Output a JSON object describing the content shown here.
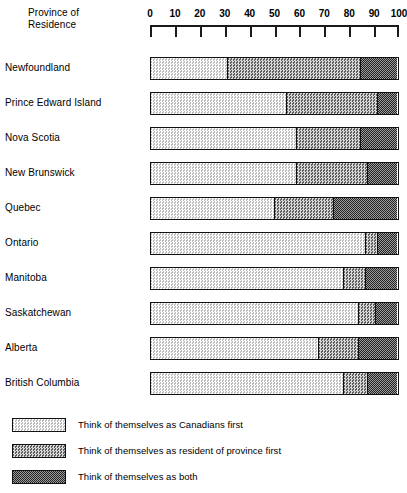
{
  "chart_data": {
    "type": "bar",
    "orientation": "horizontal",
    "stacked": true,
    "title": "Province of\nResidence",
    "xlabel": "",
    "ylabel": "Province of Residence",
    "xlim": [
      0,
      100
    ],
    "grid": false,
    "legend_position": "bottom-left",
    "axis_ticks": [
      0,
      10,
      20,
      30,
      40,
      50,
      60,
      70,
      80,
      90,
      100
    ],
    "axis_tick_labels": [
      "0",
      "10",
      "20",
      "30",
      "40",
      "50",
      "60",
      "70",
      "80",
      "90",
      "100"
    ],
    "categories": [
      "Newfoundland",
      "Prince Edward Island",
      "Nova Scotia",
      "New Brunswick",
      "Quebec",
      "Ontario",
      "Manitoba",
      "Saskatchewan",
      "Alberta",
      "British Columbia"
    ],
    "series": [
      {
        "name": "Think of themselves as Canadians first",
        "pattern": "pat-light",
        "values": [
          31,
          55,
          59,
          59,
          50,
          87,
          78,
          84,
          68,
          78
        ]
      },
      {
        "name": "Think of themselves as resident of province first",
        "pattern": "pat-mid",
        "values": [
          54,
          37,
          26,
          29,
          24,
          5,
          9,
          7,
          16,
          10
        ]
      },
      {
        "name": "Think of themselves as both",
        "pattern": "pat-dark",
        "values": [
          15,
          8,
          15,
          12,
          26,
          8,
          13,
          9,
          16,
          12
        ]
      }
    ]
  },
  "legend": {
    "items": [
      {
        "label": "Think of themselves as Canadians first",
        "pattern": "pat-light"
      },
      {
        "label": "Think of themselves as resident of province first",
        "pattern": "pat-mid"
      },
      {
        "label": "Think of themselves as both",
        "pattern": "pat-dark"
      }
    ]
  },
  "colors": {
    "ink": "#111111",
    "background": "#ffffff",
    "segment_light": "#e9e9e9",
    "segment_mid": "#b4b4b4",
    "segment_dark": "#7a7a7a"
  }
}
